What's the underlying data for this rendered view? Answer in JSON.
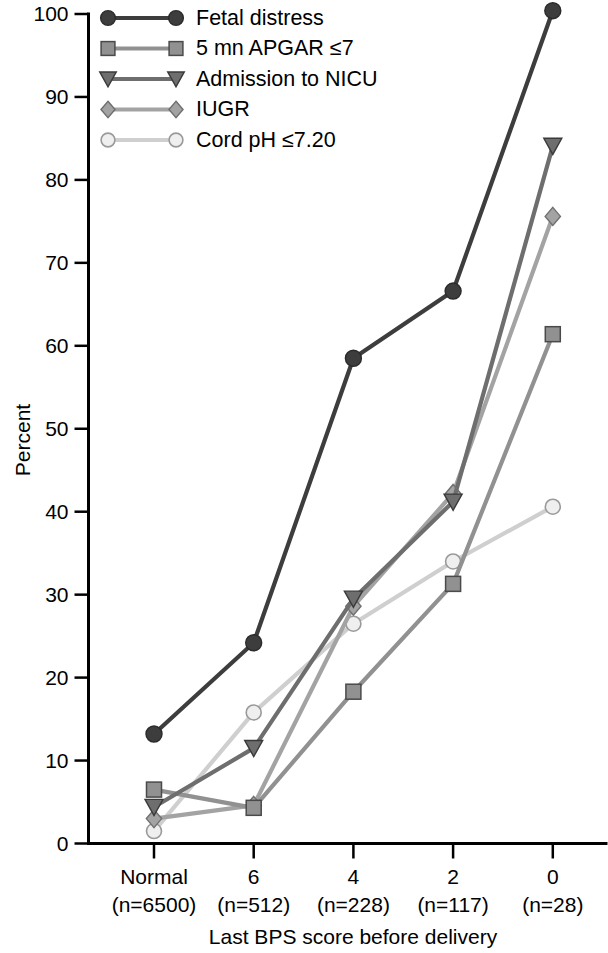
{
  "chart_data": {
    "type": "line",
    "title": "",
    "xlabel": "Last BPS score before delivery",
    "ylabel": "Percent",
    "ylim": [
      0,
      100
    ],
    "yticks": [
      "0",
      "10",
      "20",
      "30",
      "40",
      "50",
      "60",
      "70",
      "80",
      "90",
      "100"
    ],
    "categories": [
      "Normal",
      "6",
      "4",
      "2",
      "0"
    ],
    "category_counts": [
      "(n=6500)",
      "(n=512)",
      "(n=228)",
      "(n=117)",
      "(n=28)"
    ],
    "grid": false,
    "legend_position": "top-left",
    "series": [
      {
        "name": "Fetal distress",
        "marker": "circle",
        "color": "#3d3d3d",
        "values": [
          13.2,
          24.2,
          58.5,
          66.6,
          100.4
        ]
      },
      {
        "name": "5 mn APGAR ≤7",
        "marker": "square",
        "color": "#919191",
        "values": [
          6.5,
          4.3,
          18.3,
          31.3,
          61.4
        ]
      },
      {
        "name": "Admission to NICU",
        "marker": "triangle-down",
        "color": "#6e6e6e",
        "values": [
          4.4,
          11.5,
          29.5,
          41.2,
          84.1
        ]
      },
      {
        "name": "IUGR",
        "marker": "diamond",
        "color": "#a3a3a3",
        "values": [
          3.0,
          4.6,
          28.6,
          42.2,
          75.6
        ]
      },
      {
        "name": "Cord pH ≤7.20",
        "marker": "open-circle",
        "color": "#cfcfcf",
        "values": [
          1.5,
          15.8,
          26.5,
          34.0,
          40.6
        ]
      }
    ]
  }
}
